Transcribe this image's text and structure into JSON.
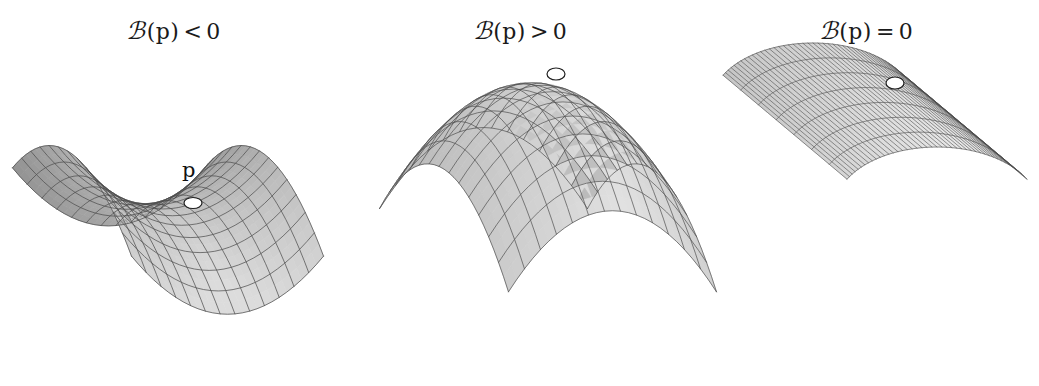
{
  "figure": {
    "title_caption": "",
    "background_color": "#ffffff",
    "width": 1039,
    "height": 386
  },
  "style": {
    "mesh_line_color": "#4a4a4a",
    "fill_light": "#d8d8d8",
    "fill_dark": "#8c8c8c",
    "outline_color": "#3c3c3c",
    "marker_fill": "#ffffff",
    "marker_stroke": "#1e1e1e",
    "label_color": "#1a1a1a"
  },
  "panels": [
    {
      "id": "negative-curvature",
      "label": {
        "script_symbol": "ℬ",
        "symbol": "K",
        "argument": "(p)",
        "relation": "<",
        "value": "0",
        "full_text": "𝒦(p) < 0"
      },
      "surface": {
        "name": "saddle",
        "type": "hyperbolic-paraboloid",
        "description": "saddle surface, negative Gaussian curvature",
        "equation": "z = x^2 - y^2",
        "point_marker": {
          "label": "p",
          "show_label": true,
          "cx": 193,
          "cy": 203,
          "rx": 9,
          "ry": 5.5,
          "label_x": 182,
          "label_y": 158
        },
        "mesh": {
          "u_lines": 15,
          "v_lines": 15
        },
        "origin": [
          176,
          215
        ],
        "scale": [
          118,
          118
        ],
        "elev": 16,
        "azim": 0
      }
    },
    {
      "id": "positive-curvature",
      "label": {
        "script_symbol": "ℬ",
        "symbol": "K",
        "argument": "(p)",
        "relation": ">",
        "value": "0",
        "full_text": "𝒦(p) > 0"
      },
      "surface": {
        "name": "dome",
        "type": "elliptic-paraboloid",
        "description": "dome surface, positive Gaussian curvature",
        "equation": "z = -(x^2 + y^2)",
        "point_marker": {
          "label": "p",
          "show_label": false,
          "cx": 556,
          "cy": 74,
          "rx": 9,
          "ry": 6
        },
        "mesh": {
          "u_lines": 15,
          "v_lines": 15
        },
        "origin": [
          545,
          95
        ],
        "scale": [
          125,
          125
        ],
        "elev": 14,
        "azim": 0
      }
    },
    {
      "id": "zero-curvature",
      "label": {
        "script_symbol": "ℬ",
        "symbol": "K",
        "argument": "(p)",
        "relation": "=",
        "value": "0",
        "full_text": "𝒦(p) = 0"
      },
      "surface": {
        "name": "cylinder",
        "type": "parabolic-cylinder",
        "description": "bent sheet / cylinder, zero Gaussian curvature",
        "equation": "z = -x^2",
        "point_marker": {
          "label": "p",
          "show_label": false,
          "cx": 895,
          "cy": 83,
          "rx": 9,
          "ry": 6
        },
        "mesh": {
          "u_lines": 9,
          "v_lines": 40
        },
        "origin": [
          880,
          100
        ],
        "scale": [
          120,
          120
        ],
        "elev": 12,
        "azim": 0
      }
    }
  ],
  "chart_data": {
    "type": "diagram",
    "items": [
      {
        "label": "𝒦(p) < 0",
        "surface": "saddle (hyperbolic paraboloid)",
        "curvature_sign": "negative"
      },
      {
        "label": "𝒦(p) > 0",
        "surface": "dome (elliptic paraboloid)",
        "curvature_sign": "positive"
      },
      {
        "label": "𝒦(p) = 0",
        "surface": "bent sheet (parabolic cylinder)",
        "curvature_sign": "zero"
      }
    ]
  }
}
